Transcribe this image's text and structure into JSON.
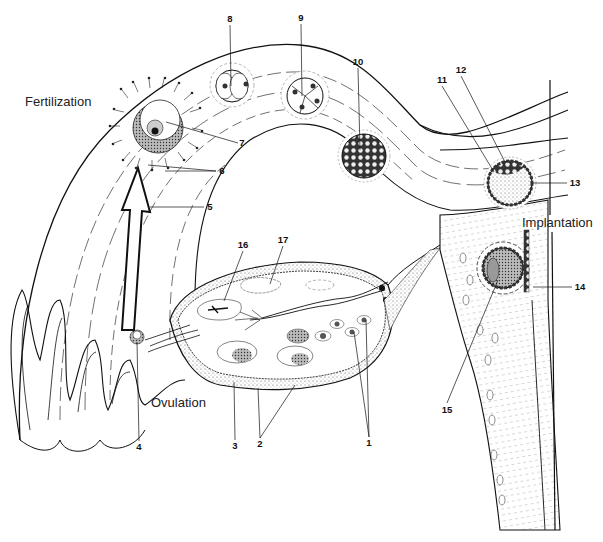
{
  "diagram": {
    "type": "anatomical-illustration",
    "captions": {
      "fertilization": "Fertilization",
      "ovulation": "Ovulation",
      "implantation": "Implantation"
    },
    "labels": [
      {
        "id": "1",
        "text": "1",
        "x": 369,
        "y": 443
      },
      {
        "id": "2",
        "text": "2",
        "x": 260,
        "y": 444
      },
      {
        "id": "3",
        "text": "3",
        "x": 235,
        "y": 446
      },
      {
        "id": "4",
        "text": "4",
        "x": 139,
        "y": 447
      },
      {
        "id": "5",
        "text": "5",
        "x": 210,
        "y": 207
      },
      {
        "id": "6",
        "text": "6",
        "x": 222,
        "y": 171
      },
      {
        "id": "7",
        "text": "7",
        "x": 242,
        "y": 143
      },
      {
        "id": "8",
        "text": "8",
        "x": 230,
        "y": 19
      },
      {
        "id": "9",
        "text": "9",
        "x": 301,
        "y": 18
      },
      {
        "id": "10",
        "text": "10",
        "x": 358,
        "y": 62
      },
      {
        "id": "11",
        "text": "11",
        "x": 442,
        "y": 80
      },
      {
        "id": "12",
        "text": "12",
        "x": 461,
        "y": 70
      },
      {
        "id": "13",
        "text": "13",
        "x": 575,
        "y": 183
      },
      {
        "id": "14",
        "text": "14",
        "x": 580,
        "y": 287
      },
      {
        "id": "15",
        "text": "15",
        "x": 447,
        "y": 410
      },
      {
        "id": "16",
        "text": "16",
        "x": 243,
        "y": 245
      },
      {
        "id": "17",
        "text": "17",
        "x": 283,
        "y": 240
      }
    ],
    "arrow": {
      "direction": "up",
      "meaning": "egg transport from ovary toward fertilization site"
    }
  }
}
